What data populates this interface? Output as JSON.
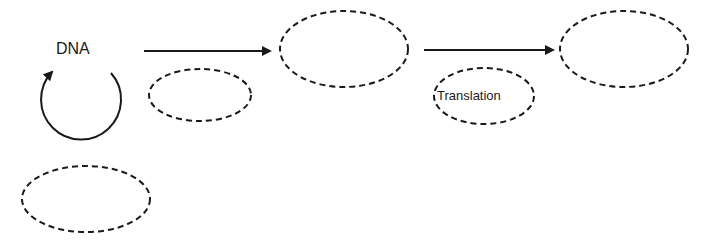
{
  "diagram": {
    "type": "flow-diagram",
    "theme": "central-dogma-fill-in",
    "colors": {
      "stroke": "#1a1a1a",
      "background": "#ffffff"
    },
    "labels": {
      "dna": "DNA",
      "translation": "Translation"
    },
    "nodes": [
      {
        "id": "dna",
        "label": "DNA",
        "shape": "text"
      },
      {
        "id": "blank-replication",
        "label": "",
        "shape": "dashed-ellipse"
      },
      {
        "id": "blank-transcription",
        "label": "",
        "shape": "dashed-ellipse"
      },
      {
        "id": "blank-rna",
        "label": "",
        "shape": "dashed-ellipse"
      },
      {
        "id": "translation",
        "label": "Translation",
        "shape": "dashed-ellipse"
      },
      {
        "id": "blank-protein",
        "label": "",
        "shape": "dashed-ellipse"
      }
    ],
    "edges": [
      {
        "from": "dna",
        "to": "dna",
        "style": "circular-arrow"
      },
      {
        "from": "dna",
        "to": "blank-rna",
        "style": "solid-arrow"
      },
      {
        "from": "blank-rna",
        "to": "blank-protein",
        "style": "solid-arrow"
      }
    ]
  }
}
